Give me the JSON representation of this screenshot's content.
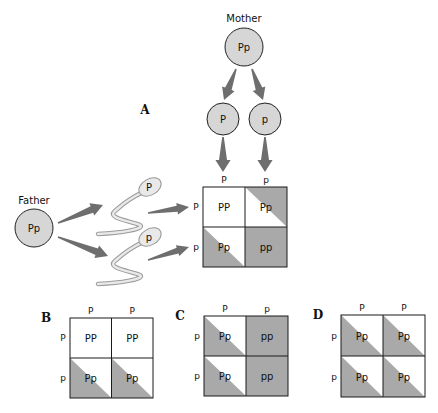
{
  "colors": {
    "background": "#ffffff",
    "circle_fill": "#d6d6d6",
    "circle_stroke": "#222222",
    "arrow": "#6e6e6e",
    "shade": "#a9a9a9",
    "grid_stroke": "#1a1a1a",
    "sperm_fill": "#e9e9e9",
    "sperm_stroke": "#9a9a9a"
  },
  "mother": {
    "label": "Mother",
    "genotype": "Pp",
    "cx": 244,
    "cy": 47,
    "r": 19,
    "gametes": [
      {
        "allele": "P",
        "cx": 223,
        "cy": 119,
        "r": 16
      },
      {
        "allele": "p",
        "cx": 265,
        "cy": 119,
        "r": 16
      }
    ]
  },
  "father": {
    "label": "Father",
    "genotype": "Pp",
    "cx": 34,
    "cy": 228,
    "r": 19,
    "sperm": [
      {
        "allele": "P",
        "hx": 150,
        "hy": 187
      },
      {
        "allele": "p",
        "hx": 150,
        "hy": 237
      }
    ]
  },
  "squares": [
    {
      "id": "A",
      "label": "A",
      "label_x": 145,
      "label_y": 114,
      "x": 203,
      "y": 187,
      "cw": 42,
      "ch": 40,
      "col_headers": [
        "P",
        "p"
      ],
      "row_headers": [
        "P",
        "p"
      ],
      "cells": [
        [
          {
            "genotype": "PP",
            "shade": "none"
          },
          {
            "genotype": "Pp",
            "shade": "upper-right"
          }
        ],
        [
          {
            "genotype": "Pp",
            "shade": "lower-left"
          },
          {
            "genotype": "pp",
            "shade": "full"
          }
        ]
      ]
    },
    {
      "id": "B",
      "label": "B",
      "label_x": 46,
      "label_y": 322,
      "x": 70,
      "y": 318,
      "cw": 41.5,
      "ch": 40,
      "col_headers": [
        "P",
        "P"
      ],
      "row_headers": [
        "P",
        "p"
      ],
      "cells": [
        [
          {
            "genotype": "PP",
            "shade": "none"
          },
          {
            "genotype": "PP",
            "shade": "none"
          }
        ],
        [
          {
            "genotype": "Pp",
            "shade": "lower-left"
          },
          {
            "genotype": "Pp",
            "shade": "lower-left"
          }
        ]
      ]
    },
    {
      "id": "C",
      "label": "C",
      "label_x": 180,
      "label_y": 320,
      "x": 204,
      "y": 316,
      "cw": 42,
      "ch": 40,
      "col_headers": [
        "P",
        "p"
      ],
      "row_headers": [
        "p",
        "p"
      ],
      "cells": [
        [
          {
            "genotype": "Pp",
            "shade": "lower-left"
          },
          {
            "genotype": "pp",
            "shade": "full"
          }
        ],
        [
          {
            "genotype": "Pp",
            "shade": "lower-left"
          },
          {
            "genotype": "pp",
            "shade": "full"
          }
        ]
      ]
    },
    {
      "id": "D",
      "label": "D",
      "label_x": 318,
      "label_y": 319,
      "x": 341,
      "y": 315,
      "cw": 42,
      "ch": 41,
      "col_headers": [
        "P",
        "P"
      ],
      "row_headers": [
        "p",
        "p"
      ],
      "cells": [
        [
          {
            "genotype": "Pp",
            "shade": "lower-left"
          },
          {
            "genotype": "Pp",
            "shade": "lower-left"
          }
        ],
        [
          {
            "genotype": "Pp",
            "shade": "lower-left"
          },
          {
            "genotype": "Pp",
            "shade": "lower-left"
          }
        ]
      ]
    }
  ]
}
